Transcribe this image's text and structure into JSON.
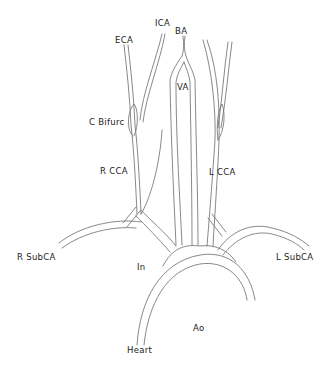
{
  "diagram": {
    "type": "anatomical-vessel-diagram",
    "labels": {
      "eca": "ECA",
      "ica": "ICA",
      "ba": "BA",
      "va": "VA",
      "c_bifurc": "C  Bifurc",
      "r_cca": "R  CCA",
      "l_cca": "L  CCA",
      "r_subca": "R  SubCA",
      "l_subca": "L  SubCA",
      "in": "In",
      "ao": "Ao",
      "heart": "Heart"
    },
    "colors": {
      "line": "#7a7a7a",
      "text": "#222222",
      "background": "#ffffff"
    }
  }
}
